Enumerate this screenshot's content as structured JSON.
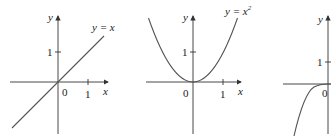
{
  "figures": [
    {
      "id": "graph-1",
      "function_label": "y = x",
      "x_axis_label": "x",
      "y_axis_label": "y",
      "origin_label": "0",
      "x_tick_label": "1",
      "y_tick_label": "1"
    },
    {
      "id": "graph-2",
      "function_label": "y = x",
      "function_exponent": "2",
      "x_axis_label": "x",
      "y_axis_label": "y",
      "origin_label": "0",
      "x_tick_label": "1",
      "y_tick_label": "1"
    },
    {
      "id": "graph-3",
      "y_axis_label": "y",
      "origin_label": "0",
      "y_tick_label": "1"
    }
  ],
  "colors": {
    "axis": "#333333",
    "curve": "#555555"
  }
}
